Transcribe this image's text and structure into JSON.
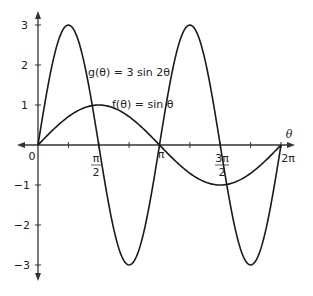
{
  "chart_data": {
    "type": "line",
    "title": "",
    "xlabel": "θ",
    "ylabel": "",
    "xlim": [
      0,
      6.2832
    ],
    "ylim": [
      -3,
      3
    ],
    "grid": false,
    "x_ticks": [
      "0",
      "π/4",
      "π/2",
      "3π/4",
      "π",
      "5π/4",
      "3π/2",
      "7π/4",
      "2π"
    ],
    "x_tick_labels": [
      {
        "value": 0,
        "label": "0"
      },
      {
        "value": 1.5708,
        "label": "π/2"
      },
      {
        "value": 3.1416,
        "label": "π"
      },
      {
        "value": 4.7124,
        "label": "3π/2"
      },
      {
        "value": 6.2832,
        "label": "2π"
      }
    ],
    "y_tick_labels": [
      "-3",
      "-2",
      "-1",
      "1",
      "2",
      "3"
    ],
    "series": [
      {
        "name": "g(θ) = 3 sin 2θ",
        "x": [
          0,
          0.7854,
          1.5708,
          2.3562,
          3.1416,
          3.927,
          4.7124,
          5.4978,
          6.2832
        ],
        "values": [
          0,
          3,
          0,
          -3,
          0,
          3,
          0,
          -3,
          0
        ]
      },
      {
        "name": "f(θ) = sin θ",
        "x": [
          0,
          0.7854,
          1.5708,
          2.3562,
          3.1416,
          3.927,
          4.7124,
          5.4978,
          6.2832
        ],
        "values": [
          0,
          0.707,
          1,
          0.707,
          0,
          -0.707,
          -1,
          -0.707,
          0
        ]
      }
    ],
    "annotations": [
      {
        "text": "g(θ) = 3 sin 2θ",
        "near": [
          1.7,
          2.2
        ]
      },
      {
        "text": "f(θ) = sin θ",
        "near": [
          2.2,
          1.2
        ]
      }
    ]
  },
  "labels": {
    "origin": "0",
    "theta": "θ",
    "pi_over_2_num": "π",
    "pi_over_2_den": "2",
    "pi": "π",
    "three_pi_over_2_num": "3π",
    "three_pi_over_2_den": "2",
    "two_pi": "2π",
    "y3": "3",
    "y2": "2",
    "y1": "1",
    "ym1": "−1",
    "ym2": "−2",
    "ym3": "−3",
    "g_label": "g(θ) = 3 sin 2θ",
    "f_label": "f(θ) = sin θ"
  }
}
